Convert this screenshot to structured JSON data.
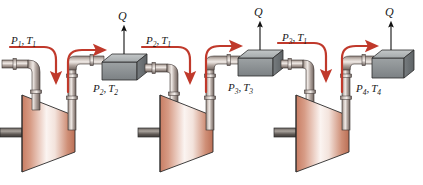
{
  "figure": {
    "background_color": "#ffffff",
    "width": 423,
    "height": 185
  },
  "colors": {
    "flow_arrow": "#c0392b",
    "arrow_dark": "#b03a28",
    "pipe_light": "#d8cfc9",
    "pipe_mid": "#a39690",
    "pipe_dark": "#6e625d",
    "cooler_top": "#b8bcbd",
    "cooler_front": "#8d9295",
    "cooler_side": "#6f7477",
    "compressor_light": "#fdf6f3",
    "compressor_mid": "#d89a85",
    "compressor_dark": "#b26a52",
    "outline": "#2b2b2b",
    "label_text": "#1a1a1a"
  },
  "labels": {
    "inlet": {
      "p": "P",
      "p_sub": "1",
      "t": "T",
      "t_sub": "1",
      "text": "P1, T1"
    },
    "stage1_out": {
      "p": "P",
      "p_sub": "2",
      "t": "T",
      "t_sub": "2",
      "text": "P2, T2"
    },
    "stage2_in": {
      "p": "P",
      "p_sub": "2",
      "t": "T",
      "t_sub": "1",
      "text": "P2, T1"
    },
    "stage2_out": {
      "p": "P",
      "p_sub": "3",
      "t": "T",
      "t_sub": "3",
      "text": "P3, T3"
    },
    "stage3_in": {
      "p": "P",
      "p_sub": "3",
      "t": "T",
      "t_sub": "1",
      "text": "P3, T1"
    },
    "stage3_out": {
      "p": "P",
      "p_sub": "4",
      "t": "T",
      "t_sub": "4",
      "text": "P4, T4"
    },
    "heat1": "Q",
    "heat2": "Q",
    "heat3": "Q",
    "comma": ","
  },
  "components": {
    "compressors": [
      {
        "name": "compressor-stage-1"
      },
      {
        "name": "compressor-stage-2"
      },
      {
        "name": "compressor-stage-3"
      }
    ],
    "intercoolers": [
      {
        "name": "intercooler-1"
      },
      {
        "name": "intercooler-2"
      },
      {
        "name": "aftercooler"
      }
    ],
    "flow_arrows": 6,
    "heat_arrows": 3
  }
}
